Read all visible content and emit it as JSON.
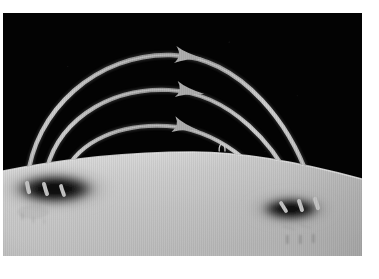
{
  "figure": {
    "title": "Coronal magnetic loops arching between a bipolar sunspot pair",
    "alt_text": "Black sky above a bright curved solar limb; three arrow-tipped bright loops arch from a dark sunspot at the left to a dark sunspot at the right.",
    "medium": "monochrome photographic plate with vertical raster texture"
  },
  "colors": {
    "page_background": "#ffffff",
    "sky": "#030303",
    "solar_surface_bright": "#d6d6d6",
    "solar_surface_mid": "#c6c6c6",
    "solar_surface_shadow": "#a8a8a8",
    "loop_stroke": "#b4b4b4",
    "loop_stroke_bright": "#d2d2d2",
    "sunspot_umbra": "#050505",
    "sunspot_penumbra": "#6a6a6a",
    "arrowhead": "#a9a9a9"
  },
  "plate": {
    "x": 3,
    "y": 13,
    "width": 359,
    "height": 243
  },
  "limb": {
    "label": "solar-limb",
    "apex_x": 190,
    "apex_y": 139,
    "left_edge_y": 158,
    "right_edge_y": 166
  },
  "sunspots": [
    {
      "id": "sunspot-left",
      "label": "leading sunspot",
      "polarity": "negative",
      "cx": 52,
      "cy": 176,
      "rx": 46,
      "ry": 17
    },
    {
      "id": "sunspot-right",
      "label": "following sunspot",
      "polarity": "positive",
      "cx": 288,
      "cy": 196,
      "rx": 34,
      "ry": 13
    }
  ],
  "loops": [
    {
      "id": "loop-outer",
      "label": "outer coronal loop",
      "path": "M 24,170 C 30,96 96,40 168,42 C 238,44 292,112 312,186",
      "arrow": {
        "tip_x": 190,
        "tip_y": 44,
        "angle": 8
      },
      "width": 4.4
    },
    {
      "id": "loop-middle",
      "label": "middle coronal loop",
      "path": "M 41,171 C 48,110 104,74 166,77 C 226,80 276,132 296,188",
      "arrow": {
        "tip_x": 190,
        "tip_y": 79,
        "angle": 10
      },
      "width": 4.2
    },
    {
      "id": "loop-inner",
      "label": "inner coronal loop",
      "path": "M 58,173 C 66,132 112,110 164,113 C 214,116 256,152 278,190",
      "arrow": {
        "tip_x": 186,
        "tip_y": 115,
        "angle": 14
      },
      "width": 4.0
    }
  ],
  "annotations": [
    {
      "id": "micro-loop",
      "label": "small emerging flux loop",
      "cx": 219,
      "cy": 133,
      "rx": 3.4,
      "ry": 5.2
    }
  ],
  "surface_marks": {
    "right_group": {
      "label": "pore markings below following spot",
      "ticks": [
        {
          "x": 284,
          "y": 222,
          "h": 9
        },
        {
          "x": 297,
          "y": 222,
          "h": 9
        },
        {
          "x": 310,
          "y": 221,
          "h": 9
        }
      ]
    },
    "left_group": {
      "label": "faint pore markings below leading spot",
      "ticks": [
        {
          "x": 19,
          "y": 200,
          "h": 7
        },
        {
          "x": 30,
          "y": 204,
          "h": 6
        },
        {
          "x": 41,
          "y": 206,
          "h": 5
        }
      ]
    }
  }
}
